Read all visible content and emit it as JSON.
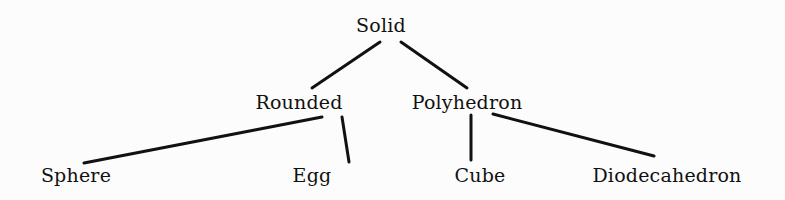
{
  "diagram": {
    "type": "tree",
    "root": "Solid",
    "nodes": [
      {
        "id": "solid",
        "label": "Solid",
        "level": 0
      },
      {
        "id": "rounded",
        "label": "Rounded",
        "level": 1,
        "parent": "solid"
      },
      {
        "id": "polyhedron",
        "label": "Polyhedron",
        "level": 1,
        "parent": "solid"
      },
      {
        "id": "sphere",
        "label": "Sphere",
        "level": 2,
        "parent": "rounded"
      },
      {
        "id": "egg",
        "label": "Egg",
        "level": 2,
        "parent": "rounded"
      },
      {
        "id": "cube",
        "label": "Cube",
        "level": 2,
        "parent": "polyhedron"
      },
      {
        "id": "diodecahedron",
        "label": "Diodecahedron",
        "level": 2,
        "parent": "polyhedron"
      }
    ],
    "edges": [
      {
        "from": "solid",
        "to": "rounded"
      },
      {
        "from": "solid",
        "to": "polyhedron"
      },
      {
        "from": "rounded",
        "to": "sphere"
      },
      {
        "from": "rounded",
        "to": "egg"
      },
      {
        "from": "polyhedron",
        "to": "cube"
      },
      {
        "from": "polyhedron",
        "to": "diodecahedron"
      }
    ],
    "labels": {
      "solid": "Solid",
      "rounded": "Rounded",
      "polyhedron": "Polyhedron",
      "sphere": "Sphere",
      "egg": "Egg",
      "cube": "Cube",
      "diodecahedron": "Diodecahedron"
    }
  },
  "colors": {
    "ink": "#111111",
    "background": "#fcfcfc"
  }
}
